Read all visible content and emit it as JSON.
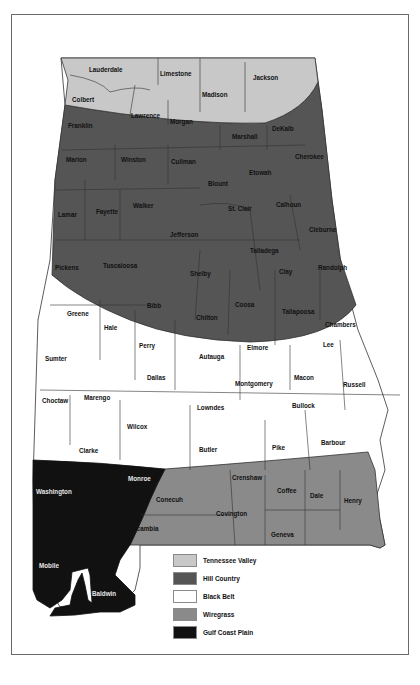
{
  "map": {
    "title": "Alabama physiographic regions by county",
    "regions": [
      {
        "id": "tennessee_valley",
        "label": "Tennessee Valley",
        "color": "#c8c8c8"
      },
      {
        "id": "hill_country",
        "label": "Hill Country",
        "color": "#555555"
      },
      {
        "id": "black_belt",
        "label": "Black Belt",
        "color": "#ffffff"
      },
      {
        "id": "wiregrass",
        "label": "Wiregrass",
        "color": "#8a8a8a"
      },
      {
        "id": "gulf_coast_plain",
        "label": "Gulf Coast Plain",
        "color": "#111111"
      }
    ],
    "counties": {
      "lauderdale": "Lauderdale",
      "limestone": "Limestone",
      "jackson": "Jackson",
      "madison": "Madison",
      "colbert": "Colbert",
      "lawrence": "Lawrence",
      "morgan": "Morgan",
      "franklin": "Franklin",
      "marshall": "Marshall",
      "dekalb": "DeKalb",
      "marion": "Marion",
      "winston": "Winston",
      "cullman": "Cullman",
      "cherokee": "Cherokee",
      "etowah": "Etowah",
      "blount": "Blount",
      "lamar": "Lamar",
      "fayette": "Fayette",
      "walker": "Walker",
      "st_clair": "St. Clair",
      "calhoun": "Calhoun",
      "jefferson": "Jefferson",
      "cleburne": "Cleburne",
      "pickens": "Pickens",
      "tuscaloosa": "Tuscaloosa",
      "shelby": "Shelby",
      "talladega": "Talladega",
      "clay": "Clay",
      "randolph": "Randolph",
      "bibb": "Bibb",
      "chilton": "Chilton",
      "coosa": "Coosa",
      "tallapoosa": "Tallapoosa",
      "greene": "Greene",
      "hale": "Hale",
      "chambers": "Chambers",
      "perry": "Perry",
      "autauga": "Autauga",
      "elmore": "Elmore",
      "lee": "Lee",
      "sumter": "Sumter",
      "dallas": "Dallas",
      "montgomery": "Montgomery",
      "macon": "Macon",
      "russell": "Russell",
      "choctaw": "Choctaw",
      "marengo": "Marengo",
      "lowndes": "Lowndes",
      "bullock": "Bullock",
      "wilcox": "Wilcox",
      "clarke": "Clarke",
      "butler": "Butler",
      "pike": "Pike",
      "barbour": "Barbour",
      "monroe": "Monroe",
      "crenshaw": "Crenshaw",
      "washington": "Washington",
      "coffee": "Coffee",
      "dale": "Dale",
      "henry": "Henry",
      "conecuh": "Conecuh",
      "covington": "Covington",
      "escambia": "Escambia",
      "geneva": "Geneva",
      "mobile": "Mobile",
      "baldwin": "Baldwin"
    }
  },
  "legend": {
    "items": [
      {
        "label": "Tennessee Valley",
        "color": "#c8c8c8"
      },
      {
        "label": "Hill Country",
        "color": "#555555"
      },
      {
        "label": "Black Belt",
        "color": "#ffffff"
      },
      {
        "label": "Wiregrass",
        "color": "#8a8a8a"
      },
      {
        "label": "Gulf Coast Plain",
        "color": "#111111"
      }
    ]
  }
}
